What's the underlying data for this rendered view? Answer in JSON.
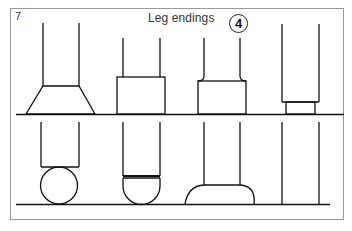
{
  "figure": {
    "number": "7",
    "title": "Leg endings",
    "badge": "4"
  },
  "colors": {
    "line": "#111111",
    "frame": "#9a9a9a",
    "background": "#ffffff"
  },
  "rows": [
    {
      "name": "top-row",
      "items": [
        {
          "name": "tapered-foot",
          "shape": "trapezoid"
        },
        {
          "name": "block-foot",
          "shape": "rectangle"
        },
        {
          "name": "flared-block-foot",
          "shape": "rectangle-with-flare"
        },
        {
          "name": "recessed-plinth-foot",
          "shape": "stepped-rectangle"
        }
      ]
    },
    {
      "name": "bottom-row",
      "items": [
        {
          "name": "ball-foot",
          "shape": "circle"
        },
        {
          "name": "bun-foot",
          "shape": "half-sphere"
        },
        {
          "name": "dome-foot",
          "shape": "dome"
        },
        {
          "name": "plain-leg",
          "shape": "none"
        }
      ]
    }
  ]
}
